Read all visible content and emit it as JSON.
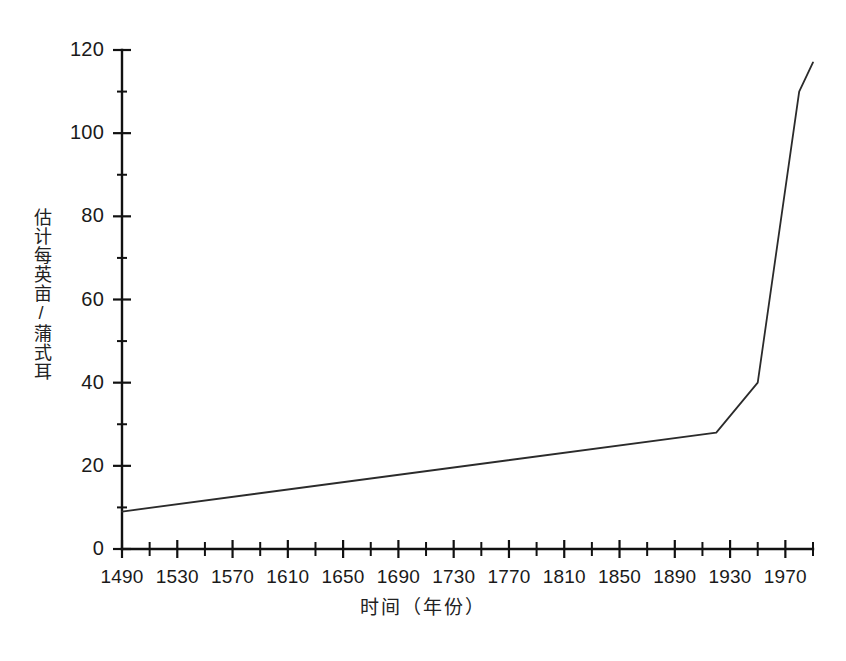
{
  "chart_data": {
    "type": "line",
    "title": "",
    "xlabel": "时间（年份）",
    "ylabel": "估计每英亩/蒲式耳",
    "xlim": [
      1490,
      1990
    ],
    "ylim": [
      0,
      120
    ],
    "grid": false,
    "legend": null,
    "x_major_ticks": [
      1490,
      1530,
      1570,
      1610,
      1650,
      1690,
      1730,
      1770,
      1810,
      1850,
      1890,
      1930,
      1970
    ],
    "x_tick_labels": [
      "1490",
      "1530",
      "1570",
      "1610",
      "1650",
      "1690",
      "1730",
      "1770",
      "1810",
      "1850",
      "1890",
      "1930",
      "1970"
    ],
    "x_minor_tick_step": 20,
    "y_major_ticks": [
      0,
      20,
      40,
      60,
      80,
      100,
      120
    ],
    "y_tick_labels": [
      "0",
      "20",
      "40",
      "60",
      "80",
      "100",
      "120"
    ],
    "y_minor_tick_step": 10,
    "series": [
      {
        "name": "估计每英亩蒲式耳",
        "color": "#2b2b2b",
        "x": [
          1490,
          1920,
          1950,
          1980,
          1990
        ],
        "values": [
          9,
          28,
          40,
          110,
          117
        ]
      }
    ]
  },
  "axes": {
    "y_title": "估计每英亩/蒲式耳",
    "x_title": "时间（年份）"
  },
  "colors": {
    "line": "#2b2b2b",
    "axis": "#111111",
    "background": "#ffffff",
    "text": "#1a1a1a"
  }
}
